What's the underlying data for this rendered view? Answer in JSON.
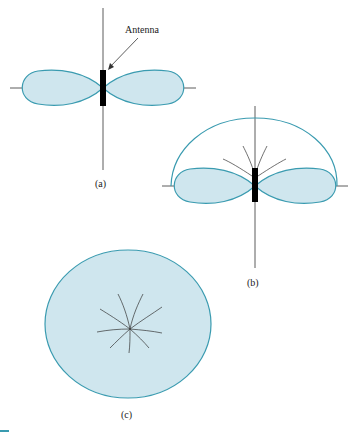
{
  "figure": {
    "callout": "Antenna",
    "panels": [
      {
        "id": "a",
        "label": "(a)",
        "description": "Figure-eight cross-section of dipole radiation pattern"
      },
      {
        "id": "b",
        "label": "(b)",
        "description": "Doughnut pattern with upper hemisphere outline and radiating lines"
      },
      {
        "id": "c",
        "label": "(c)",
        "description": "Top view: circular pattern with radiating lines"
      }
    ],
    "colors": {
      "fill": "#cfe6ee",
      "stroke": "#3a9bb0",
      "axis": "#333333",
      "antenna": "#000000"
    }
  }
}
